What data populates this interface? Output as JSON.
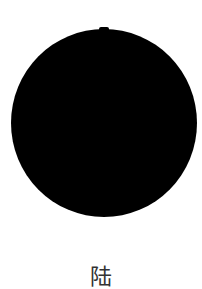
{
  "image": {
    "shape": "filled-circle",
    "fill_color": "#000000",
    "background_color": "#ffffff"
  },
  "caption": {
    "text": "陆",
    "color": "#333333"
  }
}
